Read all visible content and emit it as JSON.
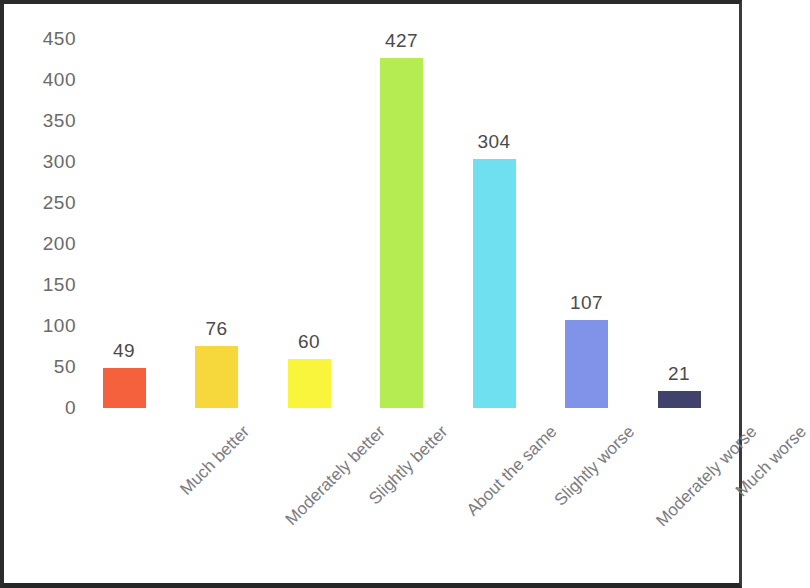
{
  "chart_data": {
    "type": "bar",
    "title": "",
    "subtitle": "",
    "xlabel": "",
    "ylabel": "",
    "categories": [
      "Much better",
      "Moderately better",
      "Slightly better",
      "About the same",
      "Slightly worse",
      "Moderately worse",
      "Much worse"
    ],
    "values": [
      49,
      76,
      60,
      427,
      304,
      107,
      21
    ],
    "value_labels": [
      "49",
      "76",
      "60",
      "427",
      "304",
      "107",
      "21"
    ],
    "bar_colors": [
      "#F4613C",
      "#F7D83C",
      "#F8F53C",
      "#B5EC52",
      "#6FE0EF",
      "#8193E8",
      "#40426B"
    ],
    "ylim": [
      0,
      450
    ],
    "ytick_step": 50,
    "ytick_labels": [
      "450",
      "400",
      "350",
      "300",
      "250",
      "200",
      "150",
      "100",
      "50",
      "0"
    ],
    "ytick_values": [
      450,
      400,
      350,
      300,
      250,
      200,
      150,
      100,
      50,
      0
    ],
    "grid": false,
    "legend": null,
    "legend_position": "none",
    "xtick_label_rotation_degrees": -45,
    "axis_label_color": "#6a6a6a",
    "value_label_color": "#4a4a4a",
    "category_label_color": "#7b7b80",
    "background_color": "#FFFFFF",
    "frame_color": "#2a2a2a"
  }
}
